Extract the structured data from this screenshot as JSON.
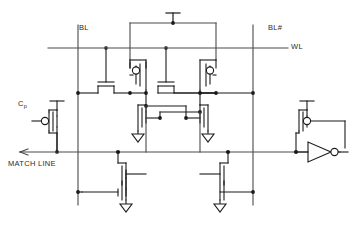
{
  "figure": {
    "kind": "circuit-schematic",
    "title": ""
  },
  "labels": {
    "bitline": "BL",
    "bitline_bar": "BL#",
    "wordline": "WL",
    "precharge_gate": "C",
    "precharge_gate_sub": "p",
    "match_line": "MATCH LINE"
  },
  "colors": {
    "wire": "#4a4a4a",
    "device": "#1a1a1a",
    "text": "#2b2b2b",
    "background": "#ffffff"
  },
  "nets": [
    {
      "name": "BL",
      "orientation": "vertical"
    },
    {
      "name": "BL#",
      "orientation": "vertical"
    },
    {
      "name": "WL",
      "orientation": "horizontal"
    },
    {
      "name": "MATCH LINE",
      "orientation": "horizontal"
    },
    {
      "name": "VDD",
      "orientation": "supply"
    },
    {
      "name": "GND",
      "orientation": "supply"
    }
  ],
  "devices": [
    {
      "id": "M1",
      "type": "nmos",
      "role": "access-left",
      "gate_net": "WL",
      "terminal_net": "BL"
    },
    {
      "id": "M2",
      "type": "nmos",
      "role": "access-right",
      "gate_net": "WL",
      "terminal_net": "BL#"
    },
    {
      "id": "M3",
      "type": "pmos",
      "role": "inverter-pull-up-left",
      "supply": "VDD"
    },
    {
      "id": "M4",
      "type": "pmos",
      "role": "inverter-pull-up-right",
      "supply": "VDD"
    },
    {
      "id": "M5",
      "type": "nmos",
      "role": "inverter-pull-down-left",
      "supply": "GND"
    },
    {
      "id": "M6",
      "type": "nmos",
      "role": "inverter-pull-down-right",
      "supply": "GND"
    },
    {
      "id": "M7",
      "type": "nmos",
      "role": "compare-upper-left",
      "terminal_net": "MATCH LINE"
    },
    {
      "id": "M8",
      "type": "nmos",
      "role": "compare-lower-left",
      "supply": "GND"
    },
    {
      "id": "M9",
      "type": "nmos",
      "role": "compare-upper-right",
      "terminal_net": "MATCH LINE"
    },
    {
      "id": "M10",
      "type": "nmos",
      "role": "compare-lower-right",
      "supply": "GND"
    },
    {
      "id": "MP",
      "type": "pmos",
      "role": "precharge",
      "gate_net": "Cp",
      "terminal_net": "MATCH LINE"
    },
    {
      "id": "MK",
      "type": "pmos",
      "role": "keeper",
      "terminal_net": "MATCH LINE"
    },
    {
      "id": "INV",
      "type": "inverter",
      "role": "match-line-output-buffer",
      "terminal_net": "MATCH LINE"
    }
  ]
}
